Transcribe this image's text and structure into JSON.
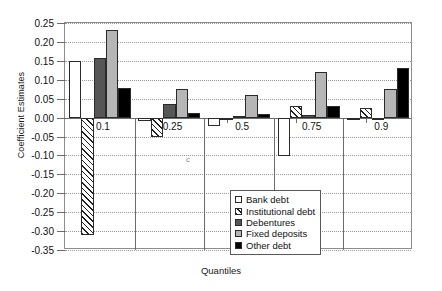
{
  "chart_data": {
    "type": "bar",
    "title": "",
    "xlabel": "Quantiles",
    "ylabel": "Coefficient Estimates",
    "categories": [
      "0.1",
      "0.25",
      "0.5",
      "0.75",
      "0.9"
    ],
    "ylim": [
      -0.35,
      0.25
    ],
    "ytick_labels": [
      "0.25",
      "0.20",
      "0.15",
      "0.10",
      "0.05",
      "0.00",
      "-0.05",
      "-0.10",
      "-0.15",
      "-0.20",
      "-0.25",
      "-0.30",
      "-0.35"
    ],
    "ytick_values": [
      0.25,
      0.2,
      0.15,
      0.1,
      0.05,
      0.0,
      -0.05,
      -0.1,
      -0.15,
      -0.2,
      -0.25,
      -0.3,
      -0.35
    ],
    "grid": true,
    "legend_position": "inside-lower-right",
    "series": [
      {
        "name": "Bank debt",
        "fill": "white",
        "values": [
          0.15,
          -0.008,
          -0.022,
          -0.102,
          -0.002
        ]
      },
      {
        "name": "Institutional debt",
        "fill": "hatch",
        "values": [
          -0.31,
          -0.052,
          -0.002,
          0.03,
          0.025
        ]
      },
      {
        "name": "Debentures",
        "fill": "dark",
        "values": [
          0.158,
          0.037,
          0.004,
          0.006,
          -0.003
        ]
      },
      {
        "name": "Fixed deposits",
        "fill": "light",
        "values": [
          0.232,
          0.076,
          0.06,
          0.121,
          0.075
        ]
      },
      {
        "name": "Other debt",
        "fill": "black",
        "values": [
          0.078,
          0.012,
          0.009,
          0.03,
          0.131
        ]
      }
    ]
  },
  "legend": {
    "items": [
      {
        "label": "Bank debt",
        "fill": "white"
      },
      {
        "label": "Institutional debt",
        "fill": "hatch"
      },
      {
        "label": "Debentures",
        "fill": "dark"
      },
      {
        "label": "Fixed deposits",
        "fill": "light"
      },
      {
        "label": "Other debt",
        "fill": "black"
      }
    ]
  },
  "artifact": {
    "text": "c"
  },
  "colors": {
    "white": "#ffffff",
    "dark": "#565656",
    "light": "#b6b6b6",
    "black": "#000000",
    "axis": "#6b6b6b",
    "grid": "#9a9a9a"
  }
}
